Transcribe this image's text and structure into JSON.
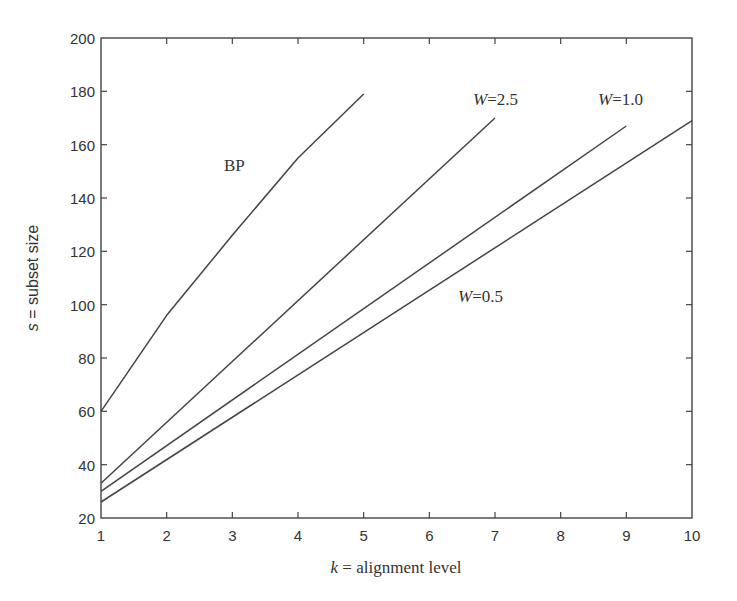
{
  "chart_data": {
    "type": "line",
    "title": "",
    "xlabel": "k = alignment level",
    "xlabel_var": "k",
    "xlabel_rest": " = alignment level",
    "ylabel": "s = subset size",
    "ylabel_var": "s",
    "ylabel_rest": " = subset size",
    "xlim": [
      1,
      10
    ],
    "ylim": [
      20,
      200
    ],
    "xticks": [
      1,
      2,
      3,
      4,
      5,
      6,
      7,
      8,
      9,
      10
    ],
    "yticks": [
      20,
      40,
      60,
      80,
      100,
      120,
      140,
      160,
      180,
      200
    ],
    "grid": false,
    "legend": "inline labels",
    "series": [
      {
        "name": "BP",
        "label_var": "",
        "label_rest": "BP",
        "x": [
          1,
          2,
          3,
          4,
          5
        ],
        "values": [
          60,
          96,
          126,
          155,
          179
        ],
        "label_pos": [
          224,
          171
        ]
      },
      {
        "name": "W=2.5",
        "label_var": "W",
        "label_rest": "=2.5",
        "x": [
          1,
          7
        ],
        "values": [
          33,
          170
        ],
        "label_pos": [
          473,
          105
        ]
      },
      {
        "name": "W=1.0",
        "label_var": "W",
        "label_rest": "=1.0",
        "x": [
          1,
          9
        ],
        "values": [
          30,
          167
        ],
        "label_pos": [
          598,
          105
        ]
      },
      {
        "name": "W=0.5",
        "label_var": "W",
        "label_rest": "=0.5",
        "x": [
          1,
          10
        ],
        "values": [
          26,
          169
        ],
        "label_pos": [
          458,
          302
        ]
      }
    ]
  },
  "layout": {
    "plot_left": 101,
    "plot_right": 692,
    "plot_top": 38,
    "plot_bottom": 518
  },
  "colors": {
    "line": "#444444",
    "text": "#333333",
    "background": "#ffffff"
  }
}
